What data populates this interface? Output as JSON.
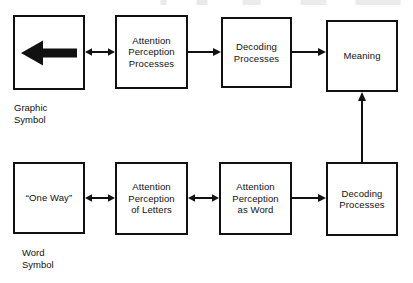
{
  "diagram": {
    "type": "flowchart",
    "width": 413,
    "height": 283,
    "stroke_color": "#111111",
    "background_color": "#ffffff",
    "rows": [
      {
        "id": "graphic-symbol-row",
        "caption": "Graphic\nSymbol"
      },
      {
        "id": "word-symbol-row",
        "caption": "Word\nSymbol"
      }
    ],
    "nodes": [
      {
        "id": "graphic-symbol-stimulus",
        "label": "",
        "icon": "left-arrow-glyph",
        "row": "graphic-symbol-row"
      },
      {
        "id": "attention-perception-processes",
        "label": "Attention\nPerception\nProcesses",
        "row": "graphic-symbol-row"
      },
      {
        "id": "decoding-processes-top",
        "label": "Decoding\nProcesses",
        "row": "graphic-symbol-row"
      },
      {
        "id": "meaning",
        "label": "Meaning",
        "row": "graphic-symbol-row"
      },
      {
        "id": "word-symbol-stimulus",
        "label": "“One Way”",
        "row": "word-symbol-row"
      },
      {
        "id": "attention-perception-of-letters",
        "label": "Attention\nPerception\nof Letters",
        "row": "word-symbol-row"
      },
      {
        "id": "attention-perception-as-word",
        "label": "Attention\nPerception\nas Word",
        "row": "word-symbol-row"
      },
      {
        "id": "decoding-processes-bottom",
        "label": "Decoding\nProcesses",
        "row": "word-symbol-row"
      }
    ],
    "connectors": [
      {
        "id": "graphic-to-attention",
        "from": "graphic-symbol-stimulus",
        "to": "attention-perception-processes",
        "style": "double-arrow",
        "orientation": "horizontal"
      },
      {
        "id": "attention-to-decoding-top",
        "from": "attention-perception-processes",
        "to": "decoding-processes-top",
        "style": "single-arrow",
        "orientation": "horizontal"
      },
      {
        "id": "decoding-to-meaning-top",
        "from": "decoding-processes-top",
        "to": "meaning",
        "style": "single-arrow",
        "orientation": "horizontal"
      },
      {
        "id": "word-to-letters",
        "from": "word-symbol-stimulus",
        "to": "attention-perception-of-letters",
        "style": "double-arrow",
        "orientation": "horizontal"
      },
      {
        "id": "letters-to-word",
        "from": "attention-perception-of-letters",
        "to": "attention-perception-as-word",
        "style": "double-arrow",
        "orientation": "horizontal"
      },
      {
        "id": "word-to-decoding-bottom",
        "from": "attention-perception-as-word",
        "to": "decoding-processes-bottom",
        "style": "single-arrow",
        "orientation": "horizontal"
      },
      {
        "id": "decoding-bottom-to-meaning",
        "from": "decoding-processes-bottom",
        "to": "meaning",
        "style": "single-arrow",
        "orientation": "vertical-up"
      }
    ]
  }
}
